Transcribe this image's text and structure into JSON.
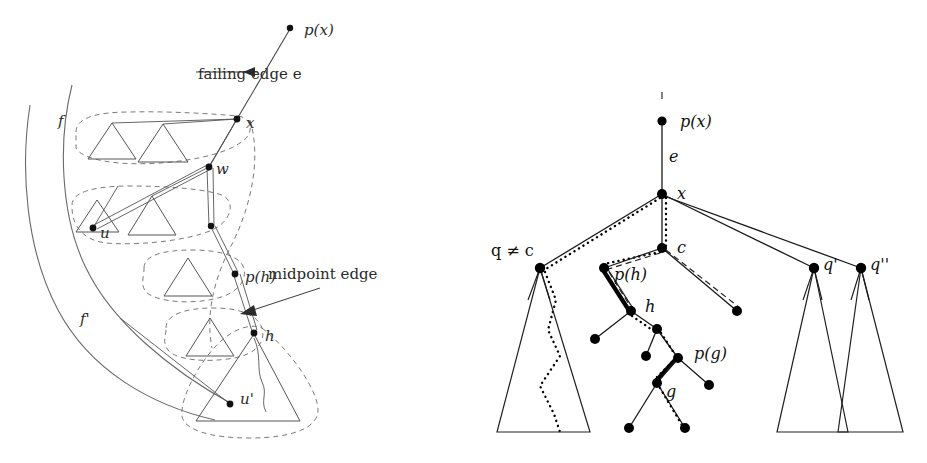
{
  "figure": {
    "background_color": "#ffffff",
    "ink_color": "#2b2b2b",
    "panels": [
      "left-abstract-faces-panel",
      "right-tree-panel"
    ]
  },
  "left_panel": {
    "name": "abstract faces and spine panel",
    "annotations": [
      {
        "id": "failing-edge",
        "text": "failing edge e",
        "x": 198,
        "y": 74
      },
      {
        "id": "midpoint-edge",
        "text": "midpoint edge",
        "x": 268,
        "y": 274
      }
    ],
    "node_labels": [
      {
        "id": "px",
        "text": "p(x)",
        "x": 304,
        "y": 35
      },
      {
        "id": "x",
        "text": "x",
        "x": 246,
        "y": 126
      },
      {
        "id": "w",
        "text": "w",
        "x": 216,
        "y": 172
      },
      {
        "id": "u",
        "text": "u",
        "x": 100,
        "y": 234
      },
      {
        "id": "ph",
        "text": "p(h)",
        "x": 245,
        "y": 281
      },
      {
        "id": "h",
        "text": "h",
        "x": 265,
        "y": 339
      },
      {
        "id": "uprime",
        "text": "u'",
        "x": 240,
        "y": 398
      },
      {
        "id": "f",
        "text": "f",
        "x": 60,
        "y": 122
      },
      {
        "id": "fprime",
        "text": "f'",
        "x": 86,
        "y": 320
      }
    ],
    "nodes": [
      {
        "id": "px",
        "x": 290,
        "y": 28
      },
      {
        "id": "x",
        "x": 237,
        "y": 119
      },
      {
        "id": "w",
        "x": 209,
        "y": 167
      },
      {
        "id": "mid-w-child",
        "x": 211,
        "y": 226
      },
      {
        "id": "u",
        "x": 93,
        "y": 228
      },
      {
        "id": "ph",
        "x": 235,
        "y": 274
      },
      {
        "id": "h",
        "x": 254,
        "y": 333
      },
      {
        "id": "uprime",
        "x": 230,
        "y": 404
      }
    ]
  },
  "right_panel": {
    "name": "rooted tree panel",
    "node_labels": [
      {
        "id": "px",
        "text": "p(x)",
        "x": 680,
        "y": 122
      },
      {
        "id": "e",
        "text": "e",
        "x": 673,
        "y": 157
      },
      {
        "id": "x",
        "text": "x",
        "x": 677,
        "y": 199
      },
      {
        "id": "c",
        "text": "c",
        "x": 677,
        "y": 253
      },
      {
        "id": "q-neq-c",
        "text": "q ≠ c",
        "x": 497,
        "y": 253
      },
      {
        "id": "ph",
        "text": "p(h)",
        "x": 625,
        "y": 277
      },
      {
        "id": "h",
        "text": "h",
        "x": 642,
        "y": 309
      },
      {
        "id": "pg",
        "text": "p(g)",
        "x": 694,
        "y": 355
      },
      {
        "id": "g",
        "text": "g",
        "x": 661,
        "y": 396
      },
      {
        "id": "qprime",
        "text": "q'",
        "x": 826,
        "y": 267
      },
      {
        "id": "qdprime",
        "text": "q''",
        "x": 873,
        "y": 267
      }
    ],
    "nodes": [
      {
        "id": "px",
        "x": 662,
        "y": 121
      },
      {
        "id": "x",
        "x": 662,
        "y": 194
      },
      {
        "id": "c",
        "x": 662,
        "y": 248
      },
      {
        "id": "q",
        "x": 540,
        "y": 268
      },
      {
        "id": "ph",
        "x": 604,
        "y": 268
      },
      {
        "id": "h",
        "x": 631,
        "y": 311
      },
      {
        "id": "h-left-child",
        "x": 595,
        "y": 339
      },
      {
        "id": "h-right-child",
        "x": 657,
        "y": 329
      },
      {
        "id": "pg",
        "x": 678,
        "y": 358
      },
      {
        "id": "pg-left-sib",
        "x": 646,
        "y": 356
      },
      {
        "id": "pg-right-child",
        "x": 709,
        "y": 385
      },
      {
        "id": "g",
        "x": 657,
        "y": 383
      },
      {
        "id": "g-left-child",
        "x": 629,
        "y": 428
      },
      {
        "id": "g-right-child",
        "x": 685,
        "y": 428
      },
      {
        "id": "c-right-child",
        "x": 737,
        "y": 311
      },
      {
        "id": "qprime",
        "x": 814,
        "y": 268
      },
      {
        "id": "qdprime",
        "x": 861,
        "y": 268
      }
    ],
    "subtree_triangles": [
      {
        "id": "q-subtree",
        "apex_x": 540,
        "apex_y": 268,
        "left_x": 497,
        "right_x": 590,
        "base_y": 432
      },
      {
        "id": "qprime-subtree",
        "apex_x": 814,
        "apex_y": 268,
        "left_x": 777,
        "right_x": 848,
        "base_y": 432
      },
      {
        "id": "qdprime-subtree",
        "apex_x": 861,
        "apex_y": 268,
        "left_x": 838,
        "right_x": 903,
        "base_y": 432
      }
    ]
  }
}
